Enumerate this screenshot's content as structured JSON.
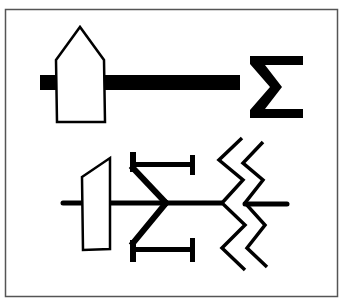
{
  "figure": {
    "frame": {
      "x": 5,
      "y": 9,
      "width": 333,
      "height": 288,
      "stroke": "#555555"
    },
    "colors": {
      "ink": "#000000",
      "paper": "#ffffff"
    }
  },
  "symbols": [
    {
      "name": "top-symbol",
      "parts": [
        "thick-shaft",
        "house-shaped-block",
        "sigma-glyph"
      ],
      "glyph": "Σ"
    },
    {
      "name": "bottom-symbol",
      "parts": [
        "thin-shaft",
        "trapezoid-block",
        "double-i-bar-fork",
        "double-zigzag-break"
      ]
    }
  ]
}
